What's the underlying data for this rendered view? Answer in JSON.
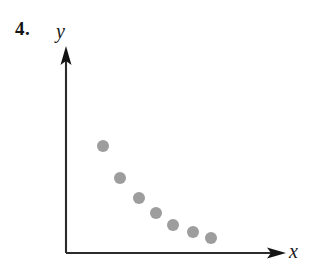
{
  "figure": {
    "problem_number": "4.",
    "background_color": "#ffffff"
  },
  "axes": {
    "x_label": "x",
    "y_label": "y",
    "axis_color": "#2b2b2b",
    "arrow_color": "#141414",
    "origin_px": {
      "x": 66,
      "y": 253
    },
    "x_axis_end_px": {
      "x": 285,
      "y": 253
    },
    "y_axis_end_px": {
      "x": 66,
      "y": 48
    }
  },
  "chart_data": {
    "type": "scatter",
    "title": "",
    "subtitle": "",
    "xlabel": "x",
    "ylabel": "y",
    "grid": false,
    "legend": false,
    "legend_position": "none",
    "axis_ticks": false,
    "tick_labels_x": [],
    "tick_labels_y": [],
    "xlim": [
      0,
      10
    ],
    "ylim": [
      0,
      10
    ],
    "annotations": [],
    "point_color": "#9d9d9d",
    "point_radius_px": 6,
    "trend": "decreasing-negative-nonlinear",
    "series": [
      {
        "name": "data",
        "points_px": [
          {
            "x": 103,
            "y": 146
          },
          {
            "x": 120,
            "y": 178
          },
          {
            "x": 139,
            "y": 198
          },
          {
            "x": 156,
            "y": 213
          },
          {
            "x": 173,
            "y": 225
          },
          {
            "x": 193,
            "y": 232
          },
          {
            "x": 211,
            "y": 238
          }
        ],
        "x": [
          1.7,
          2.5,
          3.3,
          4.1,
          4.9,
          5.8,
          6.6
        ],
        "y": [
          5.2,
          3.7,
          2.7,
          2.0,
          1.4,
          1.0,
          0.7
        ]
      }
    ]
  }
}
